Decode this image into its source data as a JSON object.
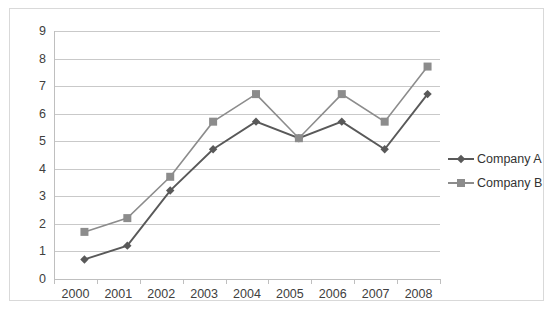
{
  "chart_data": {
    "type": "line",
    "title": "",
    "xlabel": "",
    "ylabel": "",
    "categories": [
      "2000",
      "2001",
      "2002",
      "2003",
      "2004",
      "2005",
      "2006",
      "2007",
      "2008"
    ],
    "ylim": [
      0,
      9
    ],
    "ytick_labels": [
      "0",
      "1",
      "2",
      "3",
      "4",
      "5",
      "6",
      "7",
      "8",
      "9"
    ],
    "grid": true,
    "legend_position": "right",
    "series": [
      {
        "name": "Company A",
        "marker": "diamond",
        "color": "#595959",
        "values": [
          1,
          1.5,
          3.5,
          5,
          6,
          5.4,
          6,
          5,
          7
        ]
      },
      {
        "name": "Company B",
        "marker": "square",
        "color": "#8c8c8c",
        "values": [
          2,
          2.5,
          4,
          6,
          7,
          5.4,
          7,
          6,
          8
        ]
      }
    ]
  },
  "colors": {
    "series_a": "#595959",
    "series_b": "#8c8c8c",
    "gridline": "#c9c9c9",
    "axis": "#bfbfbf",
    "border": "#d9d9d9",
    "text": "#404040"
  }
}
